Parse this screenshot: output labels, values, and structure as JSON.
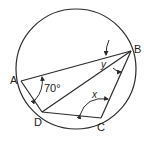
{
  "figure": {
    "type": "cyclic-quadrilateral",
    "circle": {
      "cx": 76,
      "cy": 69,
      "r": 60
    },
    "points": {
      "A": {
        "label": "A",
        "x": 21,
        "y": 81
      },
      "B": {
        "label": "B",
        "x": 131,
        "y": 51
      },
      "C": {
        "label": "C",
        "x": 101,
        "y": 118
      },
      "D": {
        "label": "D",
        "x": 42,
        "y": 112
      }
    },
    "segments": [
      "AB",
      "BC",
      "CD",
      "DA",
      "BD"
    ],
    "angles": {
      "DAB": {
        "label": "70°"
      },
      "BCD": {
        "label": "x"
      },
      "ABD": {
        "label": "y"
      }
    },
    "stroke_color": "#2b2b2b"
  }
}
